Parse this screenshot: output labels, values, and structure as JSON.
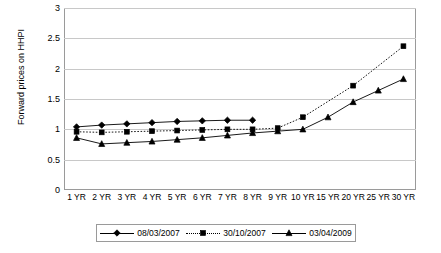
{
  "chart_data": {
    "type": "line",
    "title": "",
    "xlabel": "",
    "ylabel": "Forward prices on HHPI",
    "ylim": [
      0,
      3
    ],
    "yticks": [
      0,
      0.5,
      1,
      1.5,
      2,
      2.5,
      3
    ],
    "ytick_labels": [
      "0",
      "0.5",
      "1",
      "1.5",
      "2",
      "2.5",
      "3"
    ],
    "grid": true,
    "legend_position": "bottom",
    "categories": [
      "1 YR",
      "2 YR",
      "3 YR",
      "4 YR",
      "5 YR",
      "6 YR",
      "7 YR",
      "8 YR",
      "9 YR",
      "10 YR",
      "15 YR",
      "20 YR",
      "25 YR",
      "30 YR"
    ],
    "series": [
      {
        "name": "08/03/2007",
        "marker": "diamond",
        "line": "solid",
        "values": [
          1.04,
          1.07,
          1.09,
          1.11,
          1.13,
          1.14,
          1.15,
          1.15,
          null,
          null,
          null,
          null,
          null,
          null
        ]
      },
      {
        "name": "30/10/2007",
        "marker": "square",
        "line": "dotted",
        "values": [
          0.96,
          0.95,
          0.96,
          0.97,
          0.98,
          0.99,
          1.0,
          1.0,
          1.02,
          1.2,
          null,
          1.72,
          null,
          2.37
        ]
      },
      {
        "name": "03/04/2009",
        "marker": "triangle",
        "line": "solid",
        "values": [
          0.86,
          0.76,
          0.78,
          0.8,
          0.83,
          0.86,
          0.9,
          0.94,
          0.97,
          1.0,
          1.2,
          1.45,
          1.64,
          1.83
        ]
      }
    ]
  }
}
